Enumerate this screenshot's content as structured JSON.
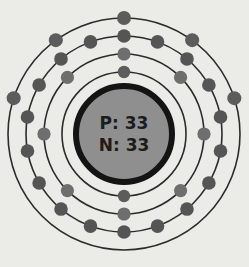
{
  "diagram": {
    "type": "bohr-atomic-model",
    "element_name": "Arsenic",
    "background_color": "#ebebe7",
    "center": {
      "x": 124,
      "y": 134
    }
  },
  "nucleus": {
    "proton_label": "P: 33",
    "neutron_label": "N: 33",
    "protons": 33,
    "neutrons": 33,
    "radius": 48,
    "fill_color": "#8f8f8f",
    "stroke_color": "#141414",
    "stroke_width": 6
  },
  "shells": [
    {
      "index": 1,
      "name": "shell-1",
      "radius": 62,
      "electron_count": 2,
      "electron_radius": 6.2,
      "electron_color": "#5c5c5c",
      "ring_color": "#2b2b2b",
      "angles": [
        270,
        90
      ]
    },
    {
      "index": 2,
      "name": "shell-2",
      "radius": 80,
      "electron_count": 8,
      "electron_radius": 6.6,
      "electron_color": "#6e6e6e",
      "ring_color": "#2b2b2b",
      "angles": [
        270,
        315,
        0,
        45,
        90,
        135,
        180,
        225
      ]
    },
    {
      "index": 3,
      "name": "shell-3",
      "radius": 98,
      "electron_count": 18,
      "electron_radius": 6.8,
      "electron_color": "#555555",
      "ring_color": "#2b2b2b",
      "angles": [
        270,
        290,
        310,
        330,
        350,
        10,
        30,
        50,
        70,
        90,
        110,
        130,
        150,
        170,
        190,
        210,
        230,
        250
      ]
    },
    {
      "index": 4,
      "name": "shell-4",
      "radius": 116,
      "electron_count": 5,
      "electron_radius": 7.0,
      "electron_color": "#5c5c5c",
      "ring_color": "#2b2b2b",
      "angles": [
        270,
        306,
        342,
        198,
        234
      ]
    }
  ],
  "electron_configuration": [
    2,
    8,
    18,
    5
  ],
  "total_electrons": 33
}
